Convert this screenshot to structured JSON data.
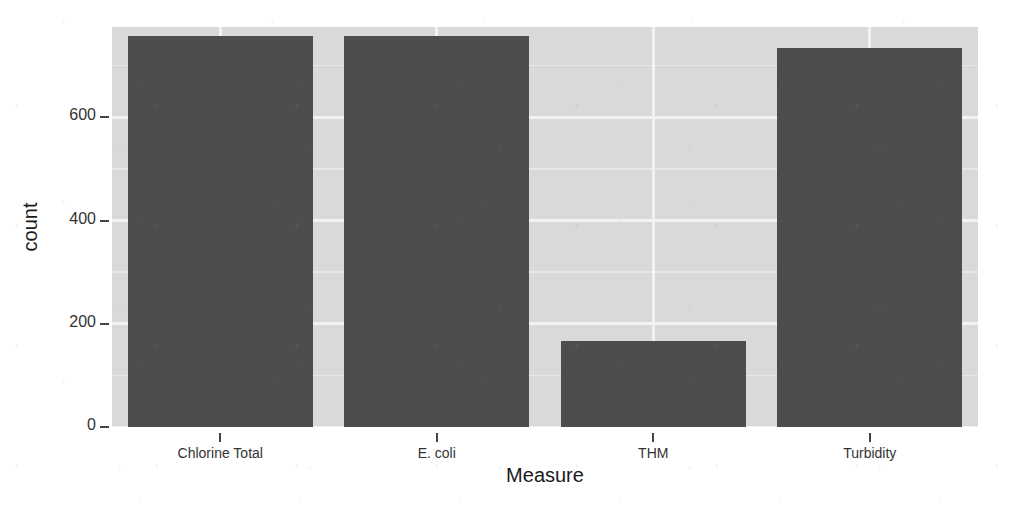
{
  "chart_data": {
    "type": "bar",
    "title": "",
    "subtitle": "",
    "xlabel": "Measure",
    "ylabel": "count",
    "categories": [
      "Chlorine Total",
      "E. coli",
      "THM",
      "Turbidity"
    ],
    "values": [
      757,
      757,
      167,
      735
    ],
    "series": [
      {
        "name": "count",
        "values": [
          757,
          757,
          167,
          735
        ]
      }
    ],
    "ylim": [
      0,
      775
    ],
    "y_ticks": [
      0,
      200,
      400,
      600
    ],
    "y_tick_labels": [
      "0",
      "200",
      "400",
      "600"
    ],
    "y_minor_ticks": [
      100,
      300,
      500,
      700
    ],
    "grid": true,
    "legend": "none",
    "bar_color": "#4d4d4d",
    "panel_background": "#d9d9d9",
    "gridline_color": "#f2f2f2",
    "plot_background": "#ffffff"
  },
  "axis": {
    "x_title": "Measure",
    "y_title": "count"
  }
}
